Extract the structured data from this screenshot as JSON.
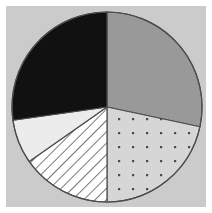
{
  "figure": {
    "width": 212,
    "height": 213,
    "background_color": "#ffffff",
    "panel_color": "#cbcbcb",
    "panel": {
      "x": 6,
      "y": 6,
      "width": 200,
      "height": 201
    }
  },
  "colors": {
    "background": "#ffffff",
    "panel": "#cbcbcb",
    "outline": "#4d4d4d",
    "slice_gray": "#999999",
    "slice_black": "#111111",
    "slice_light": "#ececec",
    "slice_white": "#ffffff",
    "hatch_line": "#555555",
    "dot": "#4a4a4a",
    "dot_field": "#d6d6d6"
  },
  "geometry": {
    "center_x": 107,
    "center_y": 107,
    "radius": 95,
    "stroke_width": 1.2
  },
  "chart_data": {
    "type": "pie",
    "title": "",
    "subtitle": "",
    "xlabel": "",
    "ylabel": "",
    "grid": false,
    "legend": "none",
    "labels": [
      "Gray slice",
      "Dotted slice",
      "Hatched slice",
      "Light gray slice",
      "Black slice"
    ],
    "values": [
      28.3,
      21.7,
      15.3,
      27.2,
      7.5
    ],
    "percentages": [
      "28.3%",
      "21.7%",
      "15.3%",
      "27.2%",
      "7.5%"
    ],
    "start_angle_deg": 0,
    "direction": "clockwise",
    "slices": [
      {
        "name": "Gray slice",
        "fill_style": "solid",
        "color": "#999999",
        "start_deg": 0,
        "end_deg": 102,
        "sweep_deg": 102,
        "value": 28.3,
        "percent": "28.3%"
      },
      {
        "name": "Dotted slice",
        "fill_style": "dotted",
        "color": "#d6d6d6",
        "start_deg": 102,
        "end_deg": 180,
        "sweep_deg": 78,
        "value": 21.7,
        "percent": "21.7%"
      },
      {
        "name": "Hatched slice",
        "fill_style": "diagonal-hatch",
        "color": "#ffffff",
        "start_deg": 180,
        "end_deg": 235,
        "sweep_deg": 55,
        "value": 15.3,
        "percent": "15.3%"
      },
      {
        "name": "Light gray slice",
        "fill_style": "solid",
        "color": "#ececec",
        "start_deg": 235,
        "end_deg": 262,
        "sweep_deg": 27,
        "value": 7.5,
        "percent": "7.5%"
      },
      {
        "name": "Black slice",
        "fill_style": "solid",
        "color": "#111111",
        "start_deg": 262,
        "end_deg": 360,
        "sweep_deg": 98,
        "value": 27.2,
        "percent": "27.2%"
      }
    ]
  }
}
